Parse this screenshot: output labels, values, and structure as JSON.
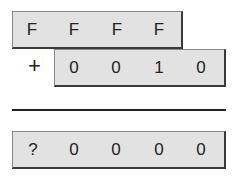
{
  "operand_a": {
    "digits": [
      "F",
      "F",
      "F",
      "F"
    ]
  },
  "operator": "+",
  "operand_b": {
    "digits": [
      "0",
      "0",
      "1",
      "0"
    ]
  },
  "result": {
    "digits": [
      "?",
      "0",
      "0",
      "0",
      "0"
    ]
  }
}
